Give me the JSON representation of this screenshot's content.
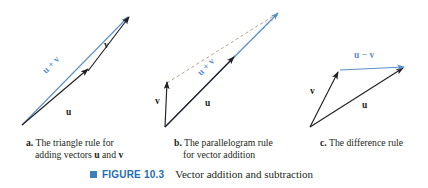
{
  "figure": {
    "number_label": "FIGURE 10.3",
    "title": "Vector addition and subtraction",
    "bullet_color": "#3d7ebd",
    "number_color": "#1f6db5"
  },
  "colors": {
    "vector_black": "#231f20",
    "vector_blue": "#5b8fc9",
    "dashed_tan": "#b09a7e",
    "dashed_blue": "#8fb4da",
    "background": "#ffffff"
  },
  "panels": [
    {
      "key": "a",
      "letter": "a.",
      "caption_line1": "The triangle rule for",
      "caption_line2_pre": "adding vectors ",
      "caption_u": "u",
      "caption_mid": " and ",
      "caption_v": "v",
      "labels": {
        "u": "u",
        "v": "v",
        "sum": "u + v"
      }
    },
    {
      "key": "b",
      "letter": "b.",
      "caption_line1": "The parallelogram rule",
      "caption_line2_pre": "for vector addition",
      "caption_u": "",
      "caption_mid": "",
      "caption_v": "",
      "labels": {
        "u": "u",
        "v": "v",
        "sum": "u + v"
      }
    },
    {
      "key": "c",
      "letter": "c.",
      "caption_line1": "The difference rule",
      "caption_line2_pre": "",
      "caption_u": "",
      "caption_mid": "",
      "caption_v": "",
      "labels": {
        "u": "u",
        "v": "v",
        "difference": "u − v"
      }
    }
  ]
}
